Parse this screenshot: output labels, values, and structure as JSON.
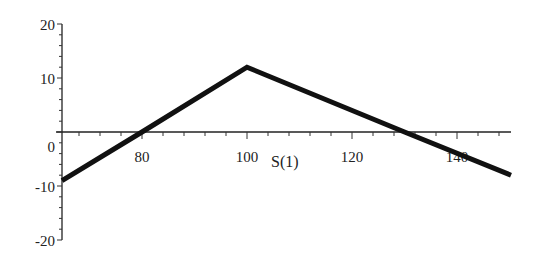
{
  "chart_data": {
    "type": "line",
    "title": "",
    "xlabel": "S(1)",
    "ylabel": "",
    "xlim": [
      65,
      150
    ],
    "ylim": [
      -20,
      20
    ],
    "grid": false,
    "legend": null,
    "x_ticks": [
      80,
      100,
      120,
      140
    ],
    "y_ticks": [
      20,
      10,
      0,
      -10,
      -20
    ],
    "x_minor_step": 4,
    "y_minor_step": 2,
    "series": [
      {
        "name": "payoff",
        "color": "#111111",
        "x": [
          65,
          80,
          100,
          130,
          150
        ],
        "y": [
          -9,
          0,
          12,
          0,
          -8
        ]
      }
    ]
  },
  "labels": {
    "xlabel": "S(1)",
    "x_ticks": [
      "80",
      "100",
      "120",
      "140"
    ],
    "y_ticks": [
      "20",
      "10",
      "0",
      "-10",
      "-20"
    ]
  }
}
